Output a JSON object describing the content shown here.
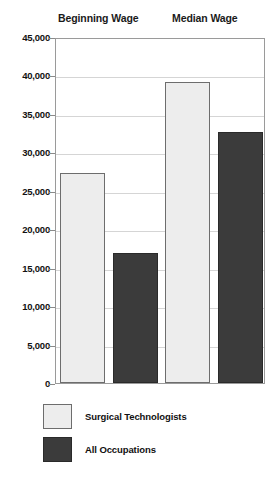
{
  "chart_data": {
    "type": "bar",
    "title": "",
    "xlabel": "",
    "ylabel": "",
    "categories": [
      "Beginning Wage",
      "Median Wage"
    ],
    "series": [
      {
        "name": "Surgical Technologists",
        "color": "#ededed",
        "values": [
          27300,
          39100
        ]
      },
      {
        "name": "All Occupations",
        "color": "#3b3b3b",
        "values": [
          16900,
          32700
        ]
      }
    ],
    "ylim": [
      0,
      45000
    ],
    "ytick_values": [
      0,
      5000,
      10000,
      15000,
      20000,
      25000,
      30000,
      35000,
      40000,
      45000
    ],
    "ytick_labels": [
      "0",
      "5,000",
      "10,000",
      "15,000",
      "20,000",
      "25,000",
      "30,000",
      "35,000",
      "40,000",
      "45,000"
    ],
    "grid": true,
    "legend_position": "bottom-left"
  },
  "group_headers": [
    {
      "label": "Beginning Wage"
    },
    {
      "label": "Median Wage"
    }
  ],
  "legend": {
    "entries": [
      {
        "label": "Surgical Technologists",
        "swatch": "light"
      },
      {
        "label": "All Occupations",
        "swatch": "dark"
      }
    ]
  },
  "colors": {
    "light_fill": "#ededed",
    "light_border": "#6d6d6d",
    "dark_fill": "#3b3b3b",
    "dark_border": "#2a2a2a",
    "gridline": "#d5d5d5",
    "frame": "#9a9a9a",
    "background": "#ffffff",
    "text": "#111111"
  }
}
